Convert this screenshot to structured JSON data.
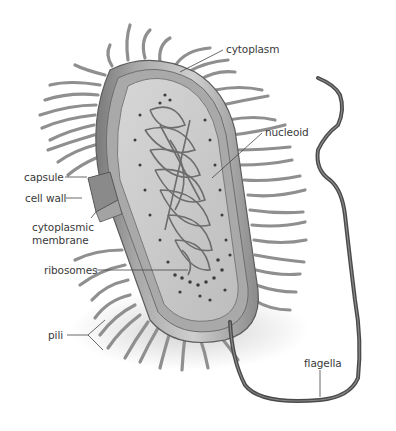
{
  "diagram": {
    "colors": {
      "background": "#ffffff",
      "label_text": "#3a3a3a",
      "leader_line": "#444444",
      "cell_wall": "#8c8c8c",
      "cytoplasm": "#c9c9c9",
      "pili": "#9a9a9a",
      "flagella": "#4a4a4a"
    },
    "labels": {
      "cytoplasm": "cytoplasm",
      "nucleoid": "nucleoid",
      "capsule": "capsule",
      "cell_wall": "cell wall",
      "cytoplasmic_membrane_line1": "cytoplasmic",
      "cytoplasmic_membrane_line2": "membrane",
      "ribosomes": "ribosomes",
      "pili": "pili",
      "flagella": "flagella"
    }
  }
}
